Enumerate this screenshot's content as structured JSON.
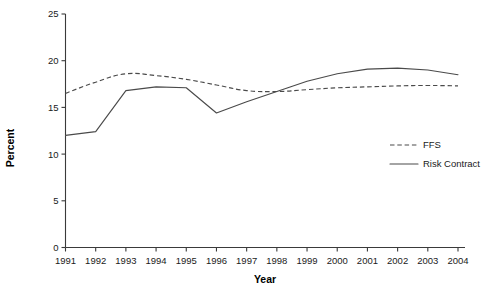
{
  "chart_data": {
    "type": "line",
    "title": "",
    "xlabel": "Year",
    "ylabel": "Percent",
    "x": [
      1991,
      1992,
      1993,
      1994,
      1995,
      1996,
      1997,
      1998,
      1999,
      2000,
      2001,
      2002,
      2003,
      2004
    ],
    "xtick_labels": [
      "1991",
      "1992",
      "1993",
      "1994",
      "1995",
      "1996",
      "1997",
      "1998",
      "1999",
      "2000",
      "2001",
      "2002",
      "2003",
      "2004"
    ],
    "ytick_labels": [
      "0",
      "5",
      "10",
      "15",
      "20",
      "25"
    ],
    "ytick_values": [
      0,
      5,
      10,
      15,
      20,
      25
    ],
    "ylim": [
      0,
      25
    ],
    "xlim": [
      1991,
      2004
    ],
    "grid": false,
    "legend_position": "right-middle",
    "series": [
      {
        "name": "FFS",
        "style": "dashed",
        "color": "#4a4a4a",
        "values": [
          16.5,
          17.7,
          18.6,
          18.4,
          18.0,
          17.4,
          16.8,
          16.7,
          16.9,
          17.1,
          17.2,
          17.3,
          17.35,
          17.3
        ]
      },
      {
        "name": "Risk Contract",
        "style": "solid",
        "color": "#4a4a4a",
        "values": [
          12.0,
          12.4,
          16.8,
          17.2,
          17.1,
          14.4,
          15.6,
          16.7,
          17.8,
          18.6,
          19.1,
          19.2,
          19.0,
          18.5
        ]
      }
    ],
    "legend": [
      {
        "label": "FFS",
        "style": "dashed"
      },
      {
        "label": "Risk Contract",
        "style": "solid"
      }
    ]
  }
}
